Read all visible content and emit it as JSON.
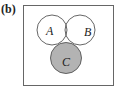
{
  "figure": {
    "panel_label": "(b)",
    "sets": [
      {
        "name": "A",
        "cx": 52,
        "cy": 30,
        "r": 15
      },
      {
        "name": "B",
        "cx": 80,
        "cy": 30,
        "r": 15
      },
      {
        "name": "C",
        "cx": 66,
        "cy": 58,
        "r": 15.5
      }
    ],
    "shaded_region": "C only (C minus A and B)",
    "colors": {
      "stroke": "#555555",
      "shade": "#b3b3b3",
      "background": "#ffffff"
    }
  }
}
